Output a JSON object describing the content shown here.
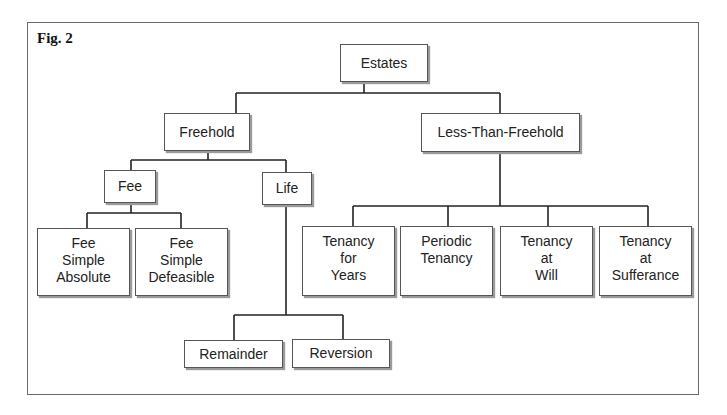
{
  "figure": {
    "label": "Fig. 2"
  },
  "tree": {
    "root": "Estates",
    "freehold": {
      "label": "Freehold",
      "fee": {
        "label": "Fee",
        "children": [
          "Fee\nSimple\nAbsolute",
          "Fee\nSimple\nDefeasible"
        ]
      },
      "life": {
        "label": "Life",
        "children": [
          "Remainder",
          "Reversion"
        ]
      }
    },
    "less_than_freehold": {
      "label": "Less-Than-Freehold",
      "children": [
        "Tenancy\nfor\nYears",
        "Periodic\nTenancy",
        "Tenancy\nat\nWill",
        "Tenancy\nat\nSufferance"
      ]
    }
  },
  "colors": {
    "line": "#222222",
    "box_border": "#555555",
    "frame": "#6a6a6a"
  }
}
